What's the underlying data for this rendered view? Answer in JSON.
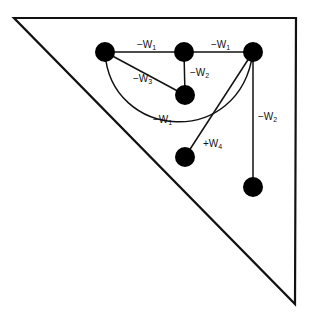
{
  "diagram": {
    "nodes": [
      {
        "id": "n1"
      },
      {
        "id": "n2"
      },
      {
        "id": "n3"
      },
      {
        "id": "n4"
      },
      {
        "id": "n5"
      },
      {
        "id": "n6"
      }
    ],
    "edges": [
      {
        "from": "n1",
        "to": "n2",
        "label": "−W",
        "sub": "1"
      },
      {
        "from": "n2",
        "to": "n3",
        "label": "−W",
        "sub": "1"
      },
      {
        "from": "n2",
        "to": "n4",
        "label": "−W",
        "sub": "2"
      },
      {
        "from": "n1",
        "to": "n4",
        "label": "−W",
        "sub": "3"
      },
      {
        "from": "n1",
        "to": "n3",
        "label": "−W",
        "sub": "1",
        "curved": true
      },
      {
        "from": "n3",
        "to": "n5",
        "label": "+W",
        "sub": "4"
      },
      {
        "from": "n3",
        "to": "n6",
        "label": "−W",
        "sub": "2"
      }
    ]
  }
}
